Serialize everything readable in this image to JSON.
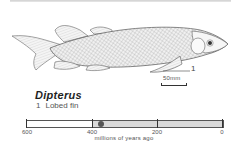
{
  "illustration": {
    "subject": "Dipterus fossil fish reconstruction",
    "callout": "1",
    "scale_label": "50mm"
  },
  "caption": {
    "genus": "Dipterus",
    "features": [
      {
        "number": "1",
        "label": "Lobed fin"
      }
    ]
  },
  "timeline": {
    "axis_title": "millions of years ago",
    "ticks": [
      "600",
      "400",
      "200",
      "0"
    ],
    "range_mya": [
      600,
      0
    ],
    "shaded_from_mya": 400,
    "marker_mya": 375,
    "colors": {
      "shade": "#d9d9d9",
      "marker": "#555555",
      "border": "#555555"
    }
  }
}
